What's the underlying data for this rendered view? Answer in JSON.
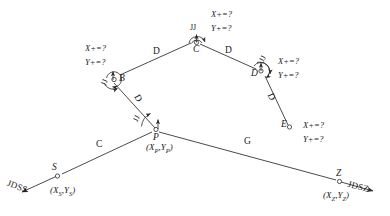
{
  "diagram": {
    "stroke_color": "#2b2b2b",
    "text_color": "#1a1a1a",
    "background": "#ffffff",
    "unknown_x": "X+=?",
    "unknown_y": "Y+=?",
    "angle_symbol": "JJ",
    "nodes": [
      {
        "id": "S",
        "label": "S",
        "coord": "(X",
        "coord_sub": "S",
        "coord_mid": ",Y",
        "coord_sub2": "S",
        "coord_end": ")",
        "x": 57,
        "y": 176
      },
      {
        "id": "P",
        "label": "P",
        "coord": "(X",
        "coord_sub": "P",
        "coord_mid": ",Y",
        "coord_sub2": "P",
        "coord_end": ")",
        "x": 156,
        "y": 131
      },
      {
        "id": "B",
        "label": "B",
        "x": 113,
        "y": 79
      },
      {
        "id": "C",
        "label": "C",
        "x": 198,
        "y": 42
      },
      {
        "id": "D",
        "label": "D",
        "x": 262,
        "y": 70
      },
      {
        "id": "E",
        "label": "E",
        "x": 289,
        "y": 128
      },
      {
        "id": "Z",
        "label": "Z",
        "coord": "(X",
        "coord_sub": "Z",
        "coord_mid": ",Y",
        "coord_sub2": "Z",
        "coord_end": ")",
        "x": 340,
        "y": 182
      }
    ],
    "edges": [
      {
        "id": "S-P",
        "label": "C",
        "from": "S",
        "to": "P"
      },
      {
        "id": "P-B",
        "label": "D",
        "from": "P",
        "to": "B"
      },
      {
        "id": "B-C",
        "label": "D",
        "from": "B",
        "to": "C"
      },
      {
        "id": "C-D",
        "label": "D",
        "from": "C",
        "to": "D"
      },
      {
        "id": "D-E",
        "label": "D",
        "from": "D",
        "to": "E"
      },
      {
        "id": "P-Z",
        "label": "G",
        "from": "P",
        "to": "Z"
      }
    ],
    "terminals": [
      {
        "id": "JDSS",
        "label": "JDSS",
        "side": "left"
      },
      {
        "id": "JDSZ",
        "label": "JDSZ",
        "side": "right"
      }
    ],
    "angle_markers": [
      {
        "at": "P",
        "label": "JJ"
      },
      {
        "at": "B",
        "label": "JJ"
      },
      {
        "at": "C",
        "label": "JJ"
      },
      {
        "at": "D",
        "label": "JJ"
      }
    ],
    "unknown_groups": [
      {
        "at": "B",
        "x_label": "X+=?",
        "y_label": "Y+=?"
      },
      {
        "at": "C",
        "x_label": "X+=?",
        "y_label": "Y+=?"
      },
      {
        "at": "D",
        "x_label": "X+=?",
        "y_label": "Y+=?"
      },
      {
        "at": "E",
        "x_label": "X+=?",
        "y_label": "Y+=?"
      }
    ]
  }
}
